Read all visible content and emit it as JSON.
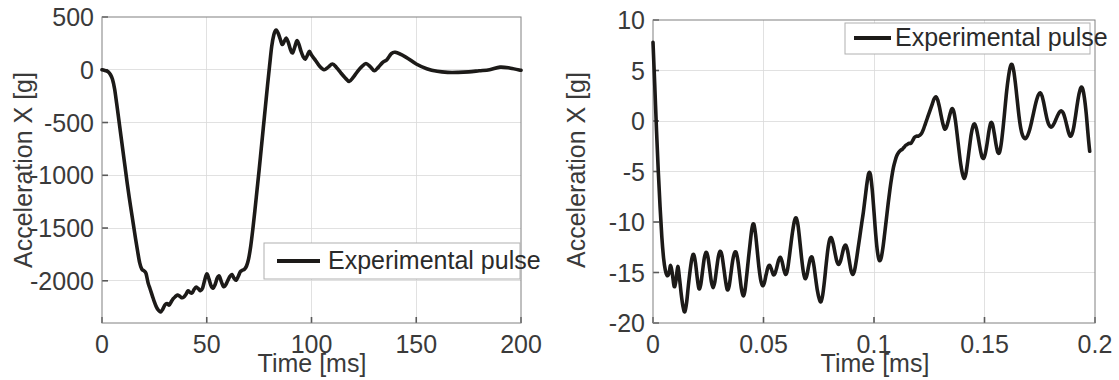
{
  "figure": {
    "background": "#ffffff",
    "line_color": "#1c1a18",
    "grid_color": "#d9d9d9",
    "axis_color": "#808080",
    "panel_count": 2
  },
  "chart_data": [
    {
      "type": "line",
      "panel": "left",
      "title": "",
      "xlabel": "Time [ms]",
      "ylabel": "Acceleration X [g]",
      "xlim": [
        0,
        200
      ],
      "ylim": [
        -2400,
        500
      ],
      "xticks": [
        0,
        50,
        100,
        150,
        200
      ],
      "xticklabels": [
        "0",
        "50",
        "100",
        "150",
        "200"
      ],
      "yticks": [
        500,
        0,
        -500,
        -1000,
        -1500,
        -2000
      ],
      "yticklabels": [
        "500",
        "0",
        "-500",
        "-1000",
        "-1500",
        "-2000"
      ],
      "grid": true,
      "legend": {
        "position": "lower-right",
        "entries": [
          "Experimental pulse"
        ]
      },
      "series": [
        {
          "name": "Experimental pulse",
          "color": "#1c1a18",
          "x": [
            0,
            1,
            2,
            3,
            4,
            5,
            6,
            7,
            8,
            9,
            10,
            11,
            12,
            13,
            14,
            15,
            16,
            17,
            18,
            19,
            20,
            21,
            22,
            23,
            24,
            25,
            26,
            27,
            28,
            29,
            30,
            31,
            32,
            33,
            34,
            35,
            36,
            37,
            38,
            39,
            40,
            41,
            42,
            43,
            44,
            45,
            46,
            47,
            48,
            49,
            50,
            51,
            52,
            53,
            54,
            55,
            56,
            57,
            58,
            59,
            60,
            61,
            62,
            63,
            64,
            65,
            66,
            67,
            68,
            69,
            70,
            71,
            72,
            73,
            74,
            75,
            76,
            77,
            78,
            79,
            80,
            81,
            82,
            83,
            84,
            85,
            86,
            87,
            88,
            89,
            90,
            91,
            92,
            93,
            94,
            95,
            96,
            97,
            98,
            99,
            100,
            102,
            104,
            106,
            108,
            110,
            112,
            114,
            116,
            118,
            120,
            122,
            124,
            126,
            128,
            130,
            132,
            134,
            136,
            138,
            140,
            145,
            150,
            155,
            160,
            165,
            170,
            175,
            180,
            185,
            190,
            195,
            200
          ],
          "y": [
            0,
            -5,
            -10,
            -20,
            -45,
            -90,
            -180,
            -320,
            -470,
            -620,
            -770,
            -920,
            -1070,
            -1210,
            -1340,
            -1470,
            -1600,
            -1720,
            -1830,
            -1890,
            -1905,
            -1930,
            -2020,
            -2080,
            -2140,
            -2200,
            -2250,
            -2280,
            -2295,
            -2270,
            -2230,
            -2215,
            -2230,
            -2200,
            -2170,
            -2150,
            -2135,
            -2145,
            -2160,
            -2155,
            -2130,
            -2095,
            -2110,
            -2115,
            -2080,
            -2060,
            -2075,
            -2095,
            -2070,
            -1995,
            -1935,
            -1980,
            -2045,
            -2070,
            -2035,
            -1975,
            -1955,
            -2010,
            -2055,
            -2040,
            -2000,
            -1960,
            -1940,
            -1975,
            -1995,
            -1960,
            -1915,
            -1900,
            -1890,
            -1860,
            -1790,
            -1670,
            -1510,
            -1330,
            -1140,
            -950,
            -750,
            -550,
            -350,
            -150,
            40,
            220,
            330,
            375,
            350,
            295,
            240,
            270,
            300,
            255,
            190,
            160,
            215,
            275,
            240,
            175,
            125,
            100,
            135,
            175,
            140,
            85,
            30,
            0,
            25,
            55,
            20,
            -30,
            -75,
            -110,
            -70,
            -15,
            30,
            60,
            30,
            -10,
            25,
            70,
            95,
            150,
            165,
            120,
            55,
            10,
            -15,
            -25,
            -25,
            -20,
            -10,
            0,
            25,
            15,
            -5,
            -15,
            -10,
            0,
            5,
            0
          ]
        }
      ]
    },
    {
      "type": "line",
      "panel": "right",
      "title": "",
      "xlabel": "Time [ms]",
      "ylabel": "Acceleration X [g]",
      "xlim": [
        0,
        0.2
      ],
      "ylim": [
        -20,
        10
      ],
      "xticks": [
        0,
        0.05,
        0.1,
        0.15,
        0.2
      ],
      "xticklabels": [
        "0",
        "0.05",
        "0.1",
        "0.15",
        "0.2"
      ],
      "yticks": [
        10,
        5,
        0,
        -5,
        -10,
        -15,
        -20
      ],
      "yticklabels": [
        "10",
        "5",
        "0",
        "-5",
        "-10",
        "-15",
        "-20"
      ],
      "grid": true,
      "legend": {
        "position": "upper-right",
        "entries": [
          "Experimental pulse"
        ]
      },
      "series": [
        {
          "name": "Experimental pulse",
          "color": "#1c1a18",
          "x": [
            0.0,
            0.0008,
            0.0016,
            0.0024,
            0.0032,
            0.004,
            0.0048,
            0.0056,
            0.0064,
            0.0072,
            0.008,
            0.0088,
            0.0096,
            0.0104,
            0.0112,
            0.012,
            0.0128,
            0.0136,
            0.0144,
            0.0152,
            0.016,
            0.0168,
            0.0176,
            0.0184,
            0.0192,
            0.02,
            0.0208,
            0.0216,
            0.0224,
            0.0232,
            0.024,
            0.0248,
            0.0256,
            0.0264,
            0.0272,
            0.028,
            0.0288,
            0.0296,
            0.0304,
            0.0312,
            0.032,
            0.0328,
            0.0336,
            0.0344,
            0.0352,
            0.036,
            0.0368,
            0.0376,
            0.0384,
            0.0392,
            0.04,
            0.0408,
            0.0416,
            0.0424,
            0.0432,
            0.044,
            0.0448,
            0.0456,
            0.0464,
            0.0472,
            0.048,
            0.0488,
            0.0496,
            0.0504,
            0.0512,
            0.052,
            0.0528,
            0.0536,
            0.0544,
            0.0552,
            0.056,
            0.0568,
            0.0576,
            0.0584,
            0.0592,
            0.06,
            0.0608,
            0.0616,
            0.0624,
            0.0632,
            0.064,
            0.0648,
            0.0656,
            0.0664,
            0.0672,
            0.068,
            0.0688,
            0.0696,
            0.0704,
            0.0712,
            0.072,
            0.0728,
            0.0736,
            0.0744,
            0.0752,
            0.076,
            0.0768,
            0.0776,
            0.0784,
            0.0792,
            0.08,
            0.0808,
            0.0816,
            0.0824,
            0.0832,
            0.084,
            0.0848,
            0.0856,
            0.0864,
            0.0872,
            0.088,
            0.0888,
            0.0896,
            0.0904,
            0.0912,
            0.092,
            0.0928,
            0.0936,
            0.0944,
            0.0952,
            0.096,
            0.0968,
            0.0976,
            0.0984,
            0.0992,
            0.1,
            0.1008,
            0.1016,
            0.1024,
            0.1032,
            0.104,
            0.1048,
            0.1056,
            0.1064,
            0.1072,
            0.108,
            0.1088,
            0.1096,
            0.1104,
            0.1112,
            0.112,
            0.1128,
            0.1136,
            0.1144,
            0.1152,
            0.116,
            0.1168,
            0.1176,
            0.1184,
            0.1192,
            0.12,
            0.1208,
            0.1216,
            0.1224,
            0.1232,
            0.124,
            0.1248,
            0.1256,
            0.1264,
            0.1272,
            0.128,
            0.1288,
            0.1296,
            0.1304,
            0.1312,
            0.132,
            0.1328,
            0.1336,
            0.1344,
            0.1352,
            0.136,
            0.1368,
            0.1376,
            0.1384,
            0.1392,
            0.14,
            0.1408,
            0.1416,
            0.1424,
            0.1432,
            0.144,
            0.1448,
            0.1456,
            0.1464,
            0.1472,
            0.148,
            0.1488,
            0.1496,
            0.1504,
            0.1512,
            0.152,
            0.1528,
            0.1536,
            0.1544,
            0.1552,
            0.156,
            0.1568,
            0.1576,
            0.1584,
            0.1592,
            0.16,
            0.1608,
            0.1616,
            0.1624,
            0.1632,
            0.164,
            0.1648,
            0.1656,
            0.1664,
            0.1672,
            0.168,
            0.1688,
            0.1696,
            0.1704,
            0.1712,
            0.172,
            0.1728,
            0.1736,
            0.1744,
            0.1752,
            0.176,
            0.1768,
            0.1776,
            0.1784,
            0.1792,
            0.18,
            0.1808,
            0.1816,
            0.1824,
            0.1832,
            0.184,
            0.1848,
            0.1856,
            0.1864,
            0.1872,
            0.188,
            0.1888,
            0.1896,
            0.1904,
            0.1912,
            0.192,
            0.1928,
            0.1936,
            0.1944,
            0.1952,
            0.196,
            0.1968,
            0.1976,
            0.1984,
            0.1992,
            0.2
          ],
          "y": [
            7.8,
            3.5,
            -1.0,
            -5.0,
            -8.5,
            -11.5,
            -13.6,
            -14.8,
            -15.3,
            -15.1,
            -14.3,
            -15.2,
            -16.4,
            -15.8,
            -14.4,
            -15.6,
            -17.2,
            -18.4,
            -18.9,
            -18.0,
            -16.3,
            -14.8,
            -13.6,
            -13.2,
            -14.0,
            -15.5,
            -16.6,
            -16.2,
            -14.9,
            -13.6,
            -13.0,
            -13.4,
            -14.6,
            -15.9,
            -16.5,
            -15.9,
            -14.6,
            -13.4,
            -12.9,
            -13.3,
            -14.5,
            -15.8,
            -16.7,
            -16.4,
            -15.2,
            -13.9,
            -13.1,
            -13.0,
            -13.8,
            -15.2,
            -16.6,
            -17.3,
            -16.8,
            -15.3,
            -13.6,
            -12.0,
            -10.6,
            -10.2,
            -11.2,
            -12.9,
            -14.6,
            -15.8,
            -16.3,
            -16.0,
            -15.2,
            -14.5,
            -14.3,
            -14.7,
            -15.2,
            -15.1,
            -14.5,
            -13.8,
            -13.5,
            -13.9,
            -14.7,
            -15.2,
            -14.8,
            -13.6,
            -12.2,
            -10.9,
            -9.9,
            -9.6,
            -10.3,
            -11.8,
            -13.5,
            -14.9,
            -15.6,
            -15.3,
            -14.4,
            -13.6,
            -13.5,
            -14.3,
            -15.6,
            -16.8,
            -17.6,
            -17.9,
            -17.2,
            -15.8,
            -14.1,
            -12.6,
            -11.7,
            -11.6,
            -12.2,
            -13.1,
            -13.9,
            -14.2,
            -13.9,
            -13.2,
            -12.5,
            -12.3,
            -12.8,
            -13.8,
            -14.8,
            -15.2,
            -14.8,
            -13.8,
            -12.6,
            -11.4,
            -10.2,
            -9.0,
            -7.6,
            -6.2,
            -5.2,
            -5.3,
            -6.8,
            -9.0,
            -11.3,
            -13.0,
            -13.8,
            -13.6,
            -12.6,
            -11.2,
            -9.7,
            -8.2,
            -6.8,
            -5.6,
            -4.6,
            -3.9,
            -3.4,
            -3.1,
            -2.9,
            -2.8,
            -2.6,
            -2.4,
            -2.3,
            -2.2,
            -2.2,
            -1.9,
            -1.6,
            -1.5,
            -1.5,
            -1.4,
            -1.2,
            -0.8,
            -0.3,
            0.2,
            0.7,
            1.2,
            1.7,
            2.2,
            2.4,
            2.1,
            1.4,
            0.5,
            -0.3,
            -0.8,
            -0.6,
            0.0,
            0.7,
            1.2,
            1.0,
            0.1,
            -1.3,
            -2.8,
            -4.2,
            -5.2,
            -5.7,
            -5.2,
            -4.0,
            -2.6,
            -1.3,
            -0.5,
            -0.3,
            -0.8,
            -1.7,
            -2.7,
            -3.5,
            -3.7,
            -3.2,
            -2.2,
            -1.0,
            -0.2,
            -0.3,
            -1.2,
            -2.3,
            -3.1,
            -3.1,
            -2.2,
            -0.7,
            1.1,
            2.9,
            4.3,
            5.3,
            5.6,
            5.0,
            3.7,
            2.1,
            0.5,
            -0.7,
            -1.4,
            -1.7,
            -1.7,
            -1.4,
            -0.9,
            -0.2,
            0.6,
            1.4,
            2.1,
            2.6,
            2.8,
            2.5,
            1.8,
            0.9,
            0.1,
            -0.4,
            -0.6,
            -0.5,
            -0.2,
            0.2,
            0.6,
            0.9,
            1.0,
            0.8,
            0.3,
            -0.4,
            -1.1,
            -1.5,
            -1.3,
            -0.6,
            0.5,
            1.7,
            2.7,
            3.3,
            3.2,
            2.3,
            0.8,
            -1.2,
            -3.0,
            -4.2
          ]
        }
      ]
    }
  ]
}
